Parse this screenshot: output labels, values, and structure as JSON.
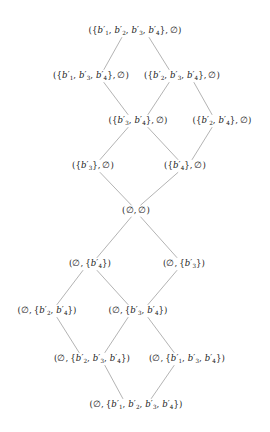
{
  "figure": {
    "type": "hasse-diagram",
    "background_color": "#ffffff",
    "text_color": "#1c1c1c",
    "edge_color": "#8a8a8a",
    "element_base": "b",
    "element_prime": "′",
    "empty_set": "∅",
    "levels": 9
  },
  "nodes": [
    {
      "id": "n0",
      "label": "({b′1, b′2, b′3, b′4}, ∅)",
      "left_set": [
        "b′1",
        "b′2",
        "b′3",
        "b′4"
      ],
      "right_set": [],
      "level": 0,
      "x": 135,
      "y": 31
    },
    {
      "id": "n1",
      "label": "({b′1, b′3, b′4}, ∅)",
      "left_set": [
        "b′1",
        "b′3",
        "b′4"
      ],
      "right_set": [],
      "level": 1,
      "x": 91,
      "y": 76
    },
    {
      "id": "n2",
      "label": "({b′2, b′3, b′4}, ∅)",
      "left_set": [
        "b′2",
        "b′3",
        "b′4"
      ],
      "right_set": [],
      "level": 1,
      "x": 182,
      "y": 76
    },
    {
      "id": "n3",
      "label": "({b′3, b′4}, ∅)",
      "left_set": [
        "b′3",
        "b′4"
      ],
      "right_set": [],
      "level": 2,
      "x": 138,
      "y": 121
    },
    {
      "id": "n4",
      "label": "({b′2, b′4}, ∅)",
      "left_set": [
        "b′2",
        "b′4"
      ],
      "right_set": [],
      "level": 2,
      "x": 222,
      "y": 121
    },
    {
      "id": "n5",
      "label": "({b′3}, ∅)",
      "left_set": [
        "b′3"
      ],
      "right_set": [],
      "level": 3,
      "x": 93,
      "y": 166
    },
    {
      "id": "n6",
      "label": "({b′4}, ∅)",
      "left_set": [
        "b′4"
      ],
      "right_set": [],
      "level": 3,
      "x": 185,
      "y": 166
    },
    {
      "id": "n7",
      "label": "(∅, ∅)",
      "left_set": [],
      "right_set": [],
      "level": 4,
      "x": 136,
      "y": 211
    },
    {
      "id": "n8",
      "label": "(∅, {b′4})",
      "left_set": [],
      "right_set": [
        "b′4"
      ],
      "level": 5,
      "x": 90,
      "y": 264
    },
    {
      "id": "n9",
      "label": "(∅, {b′3})",
      "left_set": [],
      "right_set": [
        "b′3"
      ],
      "level": 5,
      "x": 184,
      "y": 264
    },
    {
      "id": "n10",
      "label": "(∅, {b′2, b′4})",
      "left_set": [],
      "right_set": [
        "b′2",
        "b′4"
      ],
      "level": 6,
      "x": 47,
      "y": 311
    },
    {
      "id": "n11",
      "label": "(∅, {b′3, b′4})",
      "left_set": [],
      "right_set": [
        "b′3",
        "b′4"
      ],
      "level": 6,
      "x": 138,
      "y": 311
    },
    {
      "id": "n12",
      "label": "(∅, {b′2, b′3, b′4})",
      "left_set": [],
      "right_set": [
        "b′2",
        "b′3",
        "b′4"
      ],
      "level": 7,
      "x": 92,
      "y": 359
    },
    {
      "id": "n13",
      "label": "(∅, {b′1, b′3, b′4})",
      "left_set": [],
      "right_set": [
        "b′1",
        "b′3",
        "b′4"
      ],
      "level": 7,
      "x": 187,
      "y": 359
    },
    {
      "id": "n14",
      "label": "(∅, {b′1, b′2, b′3, b′4})",
      "left_set": [],
      "right_set": [
        "b′1",
        "b′2",
        "b′3",
        "b′4"
      ],
      "level": 8,
      "x": 136,
      "y": 405
    }
  ],
  "edges": [
    {
      "from": "n0",
      "to": "n1"
    },
    {
      "from": "n0",
      "to": "n2"
    },
    {
      "from": "n1",
      "to": "n3"
    },
    {
      "from": "n2",
      "to": "n3"
    },
    {
      "from": "n2",
      "to": "n4"
    },
    {
      "from": "n3",
      "to": "n5"
    },
    {
      "from": "n3",
      "to": "n6"
    },
    {
      "from": "n4",
      "to": "n6"
    },
    {
      "from": "n5",
      "to": "n7"
    },
    {
      "from": "n6",
      "to": "n7"
    },
    {
      "from": "n7",
      "to": "n8"
    },
    {
      "from": "n7",
      "to": "n9"
    },
    {
      "from": "n8",
      "to": "n10"
    },
    {
      "from": "n8",
      "to": "n11"
    },
    {
      "from": "n9",
      "to": "n11"
    },
    {
      "from": "n10",
      "to": "n12"
    },
    {
      "from": "n11",
      "to": "n12"
    },
    {
      "from": "n11",
      "to": "n13"
    },
    {
      "from": "n12",
      "to": "n14"
    },
    {
      "from": "n13",
      "to": "n14"
    }
  ]
}
